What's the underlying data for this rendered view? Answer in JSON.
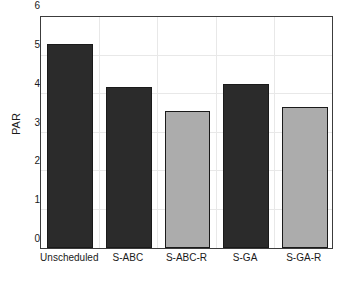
{
  "chart_data": {
    "type": "bar",
    "title": "",
    "xlabel": "",
    "ylabel": "PAR",
    "categories": [
      "Unscheduled",
      "S-ABC",
      "S-ABC-R",
      "S-GA",
      "S-GA-R"
    ],
    "values": [
      5.3,
      4.19,
      3.57,
      4.27,
      3.66
    ],
    "bar_colors": [
      "#2b2b2b",
      "#2b2b2b",
      "#acacac",
      "#2b2b2b",
      "#acacac"
    ],
    "bar_edge_color": "#1a1a1a",
    "ylim": [
      0,
      6
    ],
    "yticks": [
      0,
      1,
      2,
      3,
      4,
      5,
      6
    ],
    "ytick_labels": [
      "0",
      "1",
      "2",
      "3",
      "4",
      "5",
      "6"
    ],
    "grid": true,
    "legend": null,
    "legend_position": "none",
    "background": "#ffffff",
    "axes_color": "#3c3c3c",
    "gridline_color": "#e8e8e8"
  }
}
